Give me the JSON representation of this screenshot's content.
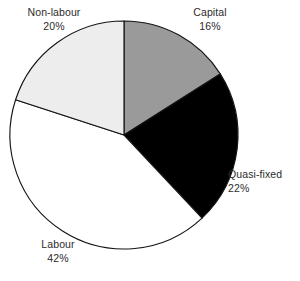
{
  "chart_data": {
    "type": "pie",
    "title": "",
    "subtitle": "",
    "xlabel": "",
    "ylabel": "",
    "legend_position": "none",
    "grid": false,
    "units": "percent",
    "start_angle_deg": 0,
    "direction": "clockwise",
    "center": {
      "x": 124,
      "y": 135
    },
    "radius": 114,
    "categories": [
      "Capital",
      "Quasi-fixed",
      "Labour",
      "Non-labour"
    ],
    "values": [
      16,
      22,
      42,
      20
    ],
    "slices": [
      {
        "name": "Capital",
        "value": 16,
        "value_label": "16%",
        "color": "#9a9a9a",
        "start_deg": 0,
        "end_deg": 57.6
      },
      {
        "name": "Quasi-fixed",
        "value": 22,
        "value_label": "22%",
        "color": "#000000",
        "start_deg": 57.6,
        "end_deg": 136.8
      },
      {
        "name": "Labour",
        "value": 42,
        "value_label": "42%",
        "color": "#ffffff",
        "start_deg": 136.8,
        "end_deg": 288.0
      },
      {
        "name": "Non-labour",
        "value": 20,
        "value_label": "20%",
        "color": "#ededed",
        "start_deg": 288.0,
        "end_deg": 360.0
      }
    ],
    "outline_color": "#151515",
    "label_color": "#2b2b2b",
    "background_color": "#ffffff"
  },
  "labels": {
    "non_labour": {
      "name": "Non-labour",
      "value": "20%"
    },
    "capital": {
      "name": "Capital",
      "value": "16%"
    },
    "quasi_fixed": {
      "name": "Quasi-fixed",
      "value": "22%"
    },
    "labour": {
      "name": "Labour",
      "value": "42%"
    }
  }
}
